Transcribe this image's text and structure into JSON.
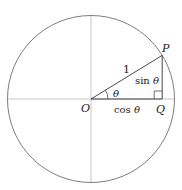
{
  "diagram": {
    "labels": {
      "origin": "O",
      "point_p": "P",
      "point_q": "Q",
      "hypotenuse": "1",
      "angle": "θ",
      "opposite": "sin θ",
      "opposite_fn": "sin",
      "adjacent": "cos θ",
      "adjacent_fn": "cos",
      "theta": "θ"
    },
    "angle_deg": 31.5,
    "radius_units": 1,
    "colors": {
      "circle": "#6e6e6e",
      "axes": "#b8b8b8",
      "triangle": "#333333",
      "text": "#222222"
    }
  }
}
